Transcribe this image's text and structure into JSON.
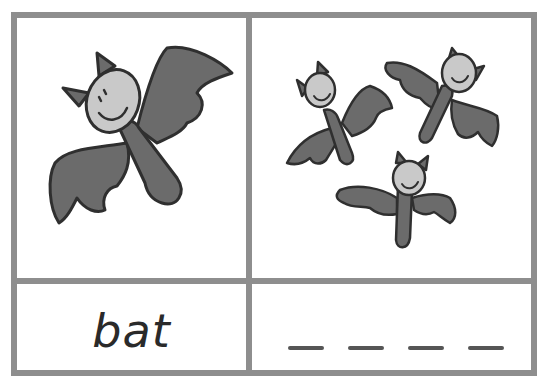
{
  "card": {
    "image_single_label": "bat-icon",
    "image_plural_label": "bats-icon",
    "word": "bat",
    "blank_count": 4
  },
  "colors": {
    "border": "#8e8e8e",
    "wing": "#6b6b6b",
    "face": "#c9c9c9",
    "outline": "#2f2f2f",
    "text": "#2a2a2a"
  }
}
